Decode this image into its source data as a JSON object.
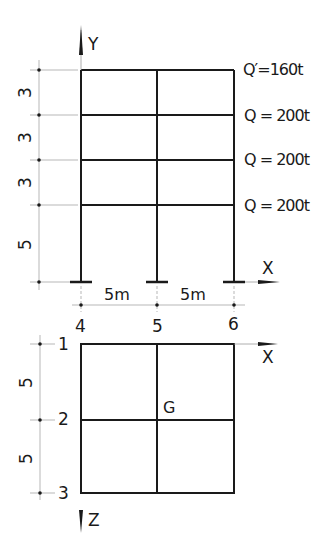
{
  "elevation": {
    "axis_vertical": "Y",
    "axis_horizontal": "X",
    "story_heights": [
      "3",
      "3",
      "3",
      "5"
    ],
    "bay_widths": [
      "5m",
      "5m"
    ],
    "loads": [
      {
        "label": "Q′=160t"
      },
      {
        "label": "Q = 200t"
      },
      {
        "label": "Q = 200t"
      },
      {
        "label": "Q = 200t"
      }
    ]
  },
  "plan": {
    "axis_x": "X",
    "axis_z": "Z",
    "column_lines": [
      "4",
      "5",
      "6"
    ],
    "row_lines": [
      "1",
      "2",
      "3"
    ],
    "row_spacings": [
      "5",
      "5"
    ],
    "centroid_label": "G"
  }
}
